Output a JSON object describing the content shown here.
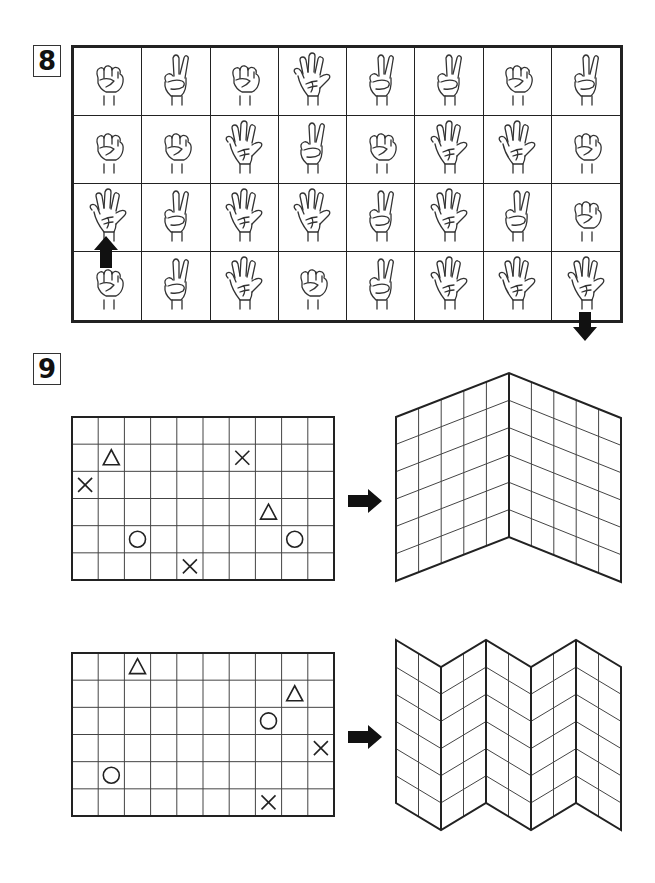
{
  "question_8": {
    "number": "8",
    "grid": {
      "rows": 4,
      "cols": 8,
      "cells": [
        [
          "rock",
          "scissors",
          "rock",
          "paper",
          "scissors",
          "scissors",
          "rock",
          "scissors"
        ],
        [
          "rock",
          "rock",
          "paper",
          "scissors",
          "rock",
          "paper",
          "paper",
          "rock"
        ],
        [
          "paper",
          "scissors",
          "paper",
          "paper",
          "scissors",
          "paper",
          "scissors",
          "rock"
        ],
        [
          "rock",
          "scissors",
          "paper",
          "rock",
          "scissors",
          "paper",
          "paper",
          "paper"
        ]
      ]
    },
    "start_arrow": {
      "direction": "up",
      "row": 2,
      "col": 0,
      "icon": "arrow-up-icon"
    },
    "end_arrow": {
      "direction": "down",
      "row": 3,
      "col": 7,
      "icon": "arrow-down-icon"
    }
  },
  "question_9": {
    "number": "9",
    "puzzles": [
      {
        "grid": {
          "rows": 6,
          "cols": 10
        },
        "symbols": [
          {
            "shape": "triangle",
            "row": 1,
            "col": 1
          },
          {
            "shape": "cross",
            "row": 1,
            "col": 6
          },
          {
            "shape": "cross",
            "row": 2,
            "col": 0
          },
          {
            "shape": "triangle",
            "row": 3,
            "col": 7
          },
          {
            "shape": "circle",
            "row": 4,
            "col": 2
          },
          {
            "shape": "circle",
            "row": 4,
            "col": 8
          },
          {
            "shape": "cross",
            "row": 5,
            "col": 4
          }
        ],
        "arrow_icon": "arrow-right-icon",
        "folded": {
          "type": "single-fold",
          "panels": 2,
          "cols_per_panel": 5,
          "rows": 6
        }
      },
      {
        "grid": {
          "rows": 6,
          "cols": 10
        },
        "symbols": [
          {
            "shape": "triangle",
            "row": 0,
            "col": 2
          },
          {
            "shape": "triangle",
            "row": 1,
            "col": 8
          },
          {
            "shape": "circle",
            "row": 2,
            "col": 7
          },
          {
            "shape": "cross",
            "row": 3,
            "col": 9
          },
          {
            "shape": "circle",
            "row": 4,
            "col": 1
          },
          {
            "shape": "cross",
            "row": 5,
            "col": 7
          }
        ],
        "arrow_icon": "arrow-right-icon",
        "folded": {
          "type": "zigzag-fold",
          "panels": 5,
          "cols_per_panel": 2,
          "rows": 6
        }
      }
    ]
  }
}
